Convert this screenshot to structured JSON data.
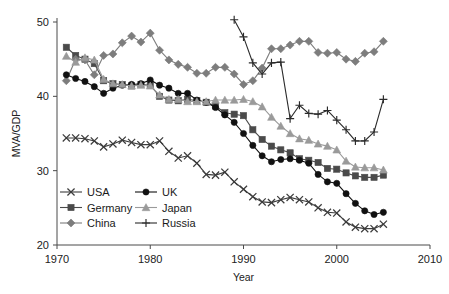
{
  "chart_data": {
    "type": "line",
    "title": "",
    "xlabel": "Year",
    "ylabel": "MVA/GDP",
    "xlim": [
      1970,
      2010
    ],
    "ylim": [
      20,
      50
    ],
    "xticks": [
      1970,
      1980,
      1990,
      2000,
      2010
    ],
    "yticks": [
      20,
      30,
      40,
      50
    ],
    "grid": false,
    "legend_position": "bottom-left",
    "series": [
      {
        "name": "USA",
        "marker": "x",
        "color": "#3c3c3c",
        "x": [
          1971,
          1972,
          1973,
          1974,
          1975,
          1976,
          1977,
          1978,
          1979,
          1980,
          1981,
          1982,
          1983,
          1984,
          1985,
          1986,
          1987,
          1988,
          1989,
          1990,
          1991,
          1992,
          1993,
          1994,
          1995,
          1996,
          1997,
          1998,
          1999,
          2000,
          2001,
          2002,
          2003,
          2004,
          2005
        ],
        "y": [
          34.4,
          34.4,
          34.3,
          34.0,
          33.2,
          33.6,
          34.1,
          33.8,
          33.5,
          33.5,
          34.0,
          32.6,
          31.7,
          32.0,
          31.0,
          29.5,
          29.4,
          29.8,
          28.5,
          27.5,
          26.5,
          25.8,
          25.7,
          26.1,
          26.4,
          26.1,
          25.8,
          25.0,
          24.4,
          24.3,
          23.1,
          22.4,
          22.2,
          22.2,
          22.8
        ]
      },
      {
        "name": "Germany",
        "marker": "square",
        "color": "#4a4a4a",
        "x": [
          1971,
          1972,
          1973,
          1974,
          1975,
          1976,
          1977,
          1978,
          1979,
          1980,
          1981,
          1982,
          1983,
          1984,
          1985,
          1986,
          1987,
          1988,
          1989,
          1990,
          1991,
          1992,
          1993,
          1994,
          1995,
          1996,
          1997,
          1998,
          1999,
          2000,
          2001,
          2002,
          2003,
          2004,
          2005
        ],
        "y": [
          46.6,
          45.5,
          45.0,
          44.4,
          42.1,
          41.7,
          41.6,
          41.4,
          41.6,
          41.5,
          40.0,
          39.5,
          39.4,
          39.6,
          39.4,
          39.2,
          38.7,
          37.8,
          37.6,
          37.4,
          35.5,
          34.2,
          33.3,
          32.8,
          32.4,
          31.6,
          31.4,
          31.1,
          30.3,
          30.2,
          29.7,
          29.3,
          29.1,
          29.1,
          29.4
        ]
      },
      {
        "name": "China",
        "marker": "diamond",
        "color": "#7d7d7d",
        "x": [
          1971,
          1972,
          1973,
          1974,
          1975,
          1976,
          1977,
          1978,
          1979,
          1980,
          1981,
          1982,
          1983,
          1984,
          1985,
          1986,
          1987,
          1988,
          1989,
          1990,
          1991,
          1992,
          1993,
          1994,
          1995,
          1996,
          1997,
          1998,
          1999,
          2000,
          2001,
          2002,
          2003,
          2004,
          2005
        ],
        "y": [
          42.1,
          45.0,
          44.9,
          42.9,
          45.5,
          45.7,
          47.2,
          48.1,
          47.3,
          48.5,
          46.2,
          44.9,
          44.3,
          43.9,
          43.1,
          43.1,
          43.9,
          43.9,
          43.0,
          41.6,
          42.1,
          43.8,
          46.4,
          46.4,
          46.9,
          47.4,
          47.4,
          45.9,
          45.8,
          45.9,
          45.0,
          44.7,
          45.8,
          46.0,
          47.4
        ]
      },
      {
        "name": "UK",
        "marker": "circle",
        "color": "#111111",
        "x": [
          1971,
          1972,
          1973,
          1974,
          1975,
          1976,
          1977,
          1978,
          1979,
          1980,
          1981,
          1982,
          1983,
          1984,
          1985,
          1986,
          1987,
          1988,
          1989,
          1990,
          1991,
          1992,
          1993,
          1994,
          1995,
          1996,
          1997,
          1998,
          1999,
          2000,
          2001,
          2002,
          2003,
          2004,
          2005
        ],
        "y": [
          42.9,
          42.4,
          42.0,
          41.3,
          40.4,
          41.1,
          41.5,
          41.6,
          41.7,
          42.2,
          41.5,
          41.1,
          40.4,
          40.4,
          39.5,
          39.2,
          38.5,
          37.5,
          36.5,
          35.0,
          33.4,
          32.0,
          31.2,
          31.5,
          31.6,
          31.4,
          31.0,
          29.5,
          28.5,
          28.3,
          26.9,
          25.6,
          24.6,
          24.1,
          24.4
        ]
      },
      {
        "name": "Japan",
        "marker": "triangle",
        "color": "#9a9a9a",
        "x": [
          1971,
          1972,
          1973,
          1974,
          1975,
          1976,
          1977,
          1978,
          1979,
          1980,
          1981,
          1982,
          1983,
          1984,
          1985,
          1986,
          1987,
          1988,
          1989,
          1990,
          1991,
          1992,
          1993,
          1994,
          1995,
          1996,
          1997,
          1998,
          1999,
          2000,
          2001,
          2002,
          2003,
          2004,
          2005
        ],
        "y": [
          45.4,
          44.6,
          45.2,
          44.9,
          42.3,
          41.7,
          41.6,
          41.4,
          41.5,
          41.4,
          40.2,
          39.6,
          39.6,
          39.3,
          39.3,
          39.3,
          39.5,
          39.5,
          39.5,
          39.6,
          39.3,
          38.6,
          37.2,
          36.0,
          35.0,
          34.3,
          34.1,
          33.6,
          33.3,
          32.8,
          31.3,
          30.5,
          30.4,
          30.4,
          30.1
        ]
      },
      {
        "name": "Russia",
        "marker": "plus",
        "color": "#2a2a2a",
        "x": [
          1989,
          1990,
          1991,
          1992,
          1993,
          1994,
          1995,
          1996,
          1997,
          1998,
          1999,
          2000,
          2001,
          2002,
          2003,
          2004,
          2005
        ],
        "y": [
          50.3,
          48.0,
          44.5,
          43.0,
          44.5,
          44.6,
          37.0,
          38.8,
          37.7,
          37.6,
          38.1,
          36.8,
          35.5,
          34.0,
          34.0,
          35.2,
          39.6
        ]
      }
    ]
  },
  "legend": {
    "entries": [
      {
        "label": "USA",
        "marker": "x",
        "color": "#3c3c3c"
      },
      {
        "label": "UK",
        "marker": "circle",
        "color": "#111111"
      },
      {
        "label": "Germany",
        "marker": "square",
        "color": "#4a4a4a"
      },
      {
        "label": "Japan",
        "marker": "triangle",
        "color": "#9a9a9a"
      },
      {
        "label": "China",
        "marker": "diamond",
        "color": "#7d7d7d"
      },
      {
        "label": "Russia",
        "marker": "plus",
        "color": "#2a2a2a"
      }
    ]
  },
  "axes": {
    "y_title": "MVA/GDP",
    "x_title": "Year",
    "y_tick_labels": [
      "50",
      "40",
      "30",
      "20"
    ],
    "x_tick_labels": [
      "1970",
      "1980",
      "1990",
      "2000",
      "2010"
    ]
  }
}
